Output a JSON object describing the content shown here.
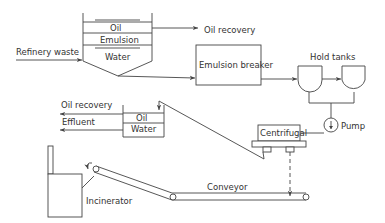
{
  "diagram": {
    "type": "process-flow",
    "labels": {
      "refinery_waste": "Refinery waste",
      "separator_oil": "Oil",
      "separator_emulsion": "Emulsion",
      "separator_water": "Water",
      "oil_recovery_top": "Oil recovery",
      "emulsion_breaker": "Emulsion breaker",
      "hold_tanks": "Hold tanks",
      "pump": "Pump",
      "centrifugal": "Centrifugal",
      "oil_recovery_left": "Oil recovery",
      "effluent": "Effluent",
      "small_oil": "Oil",
      "small_water": "Water",
      "conveyor": "Conveyor",
      "incinerator": "Incinerator"
    },
    "nodes": [
      {
        "id": "separator",
        "label": "Separator (Oil / Emulsion / Water)"
      },
      {
        "id": "emulsion_breaker",
        "label": "Emulsion breaker"
      },
      {
        "id": "hold_tank_1",
        "label": "Hold tank"
      },
      {
        "id": "hold_tank_2",
        "label": "Hold tank"
      },
      {
        "id": "pump",
        "label": "Pump"
      },
      {
        "id": "centrifugal",
        "label": "Centrifugal"
      },
      {
        "id": "settler",
        "label": "Oil / Water settler"
      },
      {
        "id": "conveyor",
        "label": "Conveyor"
      },
      {
        "id": "incinerator",
        "label": "Incinerator"
      }
    ],
    "edges": [
      {
        "from": "Refinery waste",
        "to": "separator"
      },
      {
        "from": "separator",
        "to": "Oil recovery"
      },
      {
        "from": "separator",
        "to": "emulsion_breaker"
      },
      {
        "from": "emulsion_breaker",
        "to": "hold_tank_1"
      },
      {
        "from": "hold_tank_1",
        "to": "hold_tank_2"
      },
      {
        "from": "hold_tanks",
        "to": "pump"
      },
      {
        "from": "pump",
        "to": "centrifugal"
      },
      {
        "from": "centrifugal",
        "to": "settler"
      },
      {
        "from": "settler",
        "to": "Oil recovery"
      },
      {
        "from": "settler",
        "to": "Effluent"
      },
      {
        "from": "centrifugal",
        "to": "conveyor",
        "style": "dashed"
      },
      {
        "from": "conveyor",
        "to": "incinerator"
      }
    ]
  }
}
